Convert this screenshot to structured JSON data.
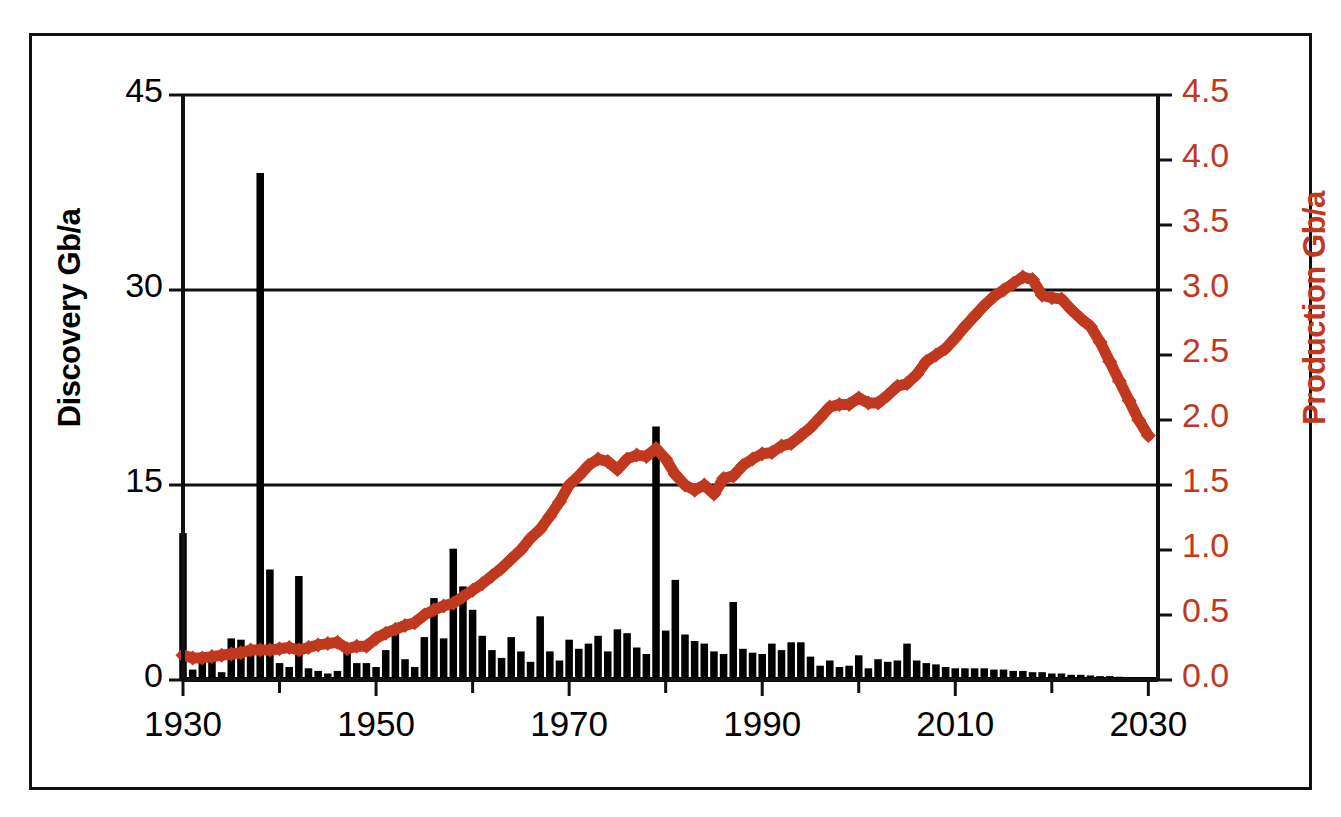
{
  "chart_data": {
    "type": "bar",
    "title": "",
    "subtitle": "",
    "xlabel": "",
    "ylabel": "Discovery Gb/a",
    "y2label": "Production Gb/a",
    "xlim": [
      1930,
      2031
    ],
    "ylim": [
      0,
      45
    ],
    "y2lim": [
      0.0,
      4.5
    ],
    "grid": true,
    "grid_lines_y": [
      15,
      30,
      45
    ],
    "legend": "none",
    "colors": {
      "discovery_bars": "#000000",
      "production_line": "#c0391f",
      "axis": "#111111",
      "background": "#ffffff"
    },
    "x_tick_labels": [
      "1930",
      "1950",
      "1970",
      "1990",
      "2010",
      "2030"
    ],
    "x_tick_values": [
      1930,
      1950,
      1970,
      1990,
      2010,
      2030
    ],
    "x_minor_tick_values": [
      1940,
      1960,
      1980,
      2000,
      2020
    ],
    "y_tick_labels": [
      "0",
      "15",
      "30",
      "45"
    ],
    "y_tick_values": [
      0,
      15,
      30,
      45
    ],
    "y2_tick_labels": [
      "0.0",
      "0.5",
      "1.0",
      "1.5",
      "2.0",
      "2.5",
      "3.0",
      "3.5",
      "4.0",
      "4.5"
    ],
    "y2_tick_values": [
      0.0,
      0.5,
      1.0,
      1.5,
      2.0,
      2.5,
      3.0,
      3.5,
      4.0,
      4.5
    ],
    "series": [
      {
        "name": "Discovery",
        "type": "bar",
        "axis": "left",
        "units": "Gb/a",
        "x": [
          1930,
          1931,
          1932,
          1933,
          1934,
          1935,
          1936,
          1937,
          1938,
          1939,
          1940,
          1941,
          1942,
          1943,
          1944,
          1945,
          1946,
          1947,
          1948,
          1949,
          1950,
          1951,
          1952,
          1953,
          1954,
          1955,
          1956,
          1957,
          1958,
          1959,
          1960,
          1961,
          1962,
          1963,
          1964,
          1965,
          1966,
          1967,
          1968,
          1969,
          1970,
          1971,
          1972,
          1973,
          1974,
          1975,
          1976,
          1977,
          1978,
          1979,
          1980,
          1981,
          1982,
          1983,
          1984,
          1985,
          1986,
          1987,
          1988,
          1989,
          1990,
          1991,
          1992,
          1993,
          1994,
          1995,
          1996,
          1997,
          1998,
          1999,
          2000,
          2001,
          2002,
          2003,
          2004,
          2005,
          2006,
          2007,
          2008,
          2009,
          2010,
          2011,
          2012,
          2013,
          2014,
          2015,
          2016,
          2017,
          2018,
          2019,
          2020,
          2021,
          2022,
          2023,
          2024,
          2025,
          2026,
          2027,
          2028,
          2029,
          2030
        ],
        "values": [
          11.3,
          0.8,
          1.6,
          1.6,
          0.6,
          3.2,
          3.1,
          2.5,
          39.0,
          8.5,
          1.3,
          1.0,
          8.0,
          0.9,
          0.7,
          0.5,
          0.7,
          2.2,
          1.3,
          1.3,
          1.0,
          2.3,
          4.2,
          1.6,
          1.0,
          3.3,
          6.3,
          3.2,
          10.1,
          7.2,
          5.4,
          3.4,
          2.3,
          1.7,
          3.3,
          2.2,
          1.4,
          4.9,
          2.2,
          1.5,
          3.1,
          2.4,
          2.8,
          3.4,
          2.2,
          3.9,
          3.6,
          2.5,
          2.0,
          19.5,
          3.8,
          7.7,
          3.5,
          3.0,
          2.8,
          2.2,
          2.0,
          6.0,
          2.4,
          2.1,
          2.0,
          2.8,
          2.3,
          2.9,
          2.9,
          1.8,
          1.1,
          1.5,
          1.0,
          1.1,
          1.9,
          0.9,
          1.6,
          1.4,
          1.5,
          2.8,
          1.5,
          1.3,
          1.2,
          1.0,
          0.9,
          0.9,
          0.9,
          0.9,
          0.8,
          0.8,
          0.7,
          0.7,
          0.6,
          0.6,
          0.5,
          0.5,
          0.4,
          0.4,
          0.35,
          0.3,
          0.3,
          0.25,
          0.2,
          0.2,
          0.15
        ]
      },
      {
        "name": "Production",
        "type": "line",
        "axis": "right",
        "units": "Gb/a",
        "marker": "diamond",
        "x": [
          1930,
          1931,
          1932,
          1933,
          1934,
          1935,
          1936,
          1937,
          1938,
          1939,
          1940,
          1941,
          1942,
          1943,
          1944,
          1945,
          1946,
          1947,
          1948,
          1949,
          1950,
          1951,
          1952,
          1953,
          1954,
          1955,
          1956,
          1957,
          1958,
          1959,
          1960,
          1961,
          1962,
          1963,
          1964,
          1965,
          1966,
          1967,
          1968,
          1969,
          1970,
          1971,
          1972,
          1973,
          1974,
          1975,
          1976,
          1977,
          1978,
          1979,
          1980,
          1981,
          1982,
          1983,
          1984,
          1985,
          1986,
          1987,
          1988,
          1989,
          1990,
          1991,
          1992,
          1993,
          1994,
          1995,
          1996,
          1997,
          1998,
          1999,
          2000,
          2001,
          2002,
          2003,
          2004,
          2005,
          2006,
          2007,
          2008,
          2009,
          2010,
          2011,
          2012,
          2013,
          2014,
          2015,
          2016,
          2017,
          2018,
          2019,
          2020,
          2021,
          2022,
          2023,
          2024,
          2025,
          2026,
          2027,
          2028,
          2029,
          2030
        ],
        "values": [
          0.19,
          0.17,
          0.17,
          0.18,
          0.19,
          0.2,
          0.21,
          0.23,
          0.23,
          0.23,
          0.24,
          0.25,
          0.23,
          0.25,
          0.27,
          0.28,
          0.29,
          0.24,
          0.26,
          0.26,
          0.32,
          0.36,
          0.39,
          0.42,
          0.44,
          0.5,
          0.54,
          0.57,
          0.59,
          0.64,
          0.69,
          0.74,
          0.8,
          0.86,
          0.93,
          1.0,
          1.09,
          1.16,
          1.26,
          1.37,
          1.5,
          1.57,
          1.65,
          1.7,
          1.68,
          1.62,
          1.7,
          1.73,
          1.72,
          1.78,
          1.7,
          1.58,
          1.5,
          1.46,
          1.5,
          1.43,
          1.55,
          1.57,
          1.65,
          1.7,
          1.74,
          1.75,
          1.8,
          1.82,
          1.88,
          1.94,
          2.02,
          2.1,
          2.12,
          2.12,
          2.17,
          2.13,
          2.13,
          2.19,
          2.26,
          2.28,
          2.35,
          2.45,
          2.5,
          2.55,
          2.63,
          2.72,
          2.8,
          2.88,
          2.95,
          3.0,
          3.05,
          3.1,
          3.08,
          2.96,
          2.94,
          2.93,
          2.85,
          2.78,
          2.72,
          2.6,
          2.45,
          2.3,
          2.15,
          2.0,
          1.88
        ]
      }
    ]
  },
  "axes": {
    "left_title": "Discovery Gb/a",
    "right_title": "Production Gb/a"
  }
}
